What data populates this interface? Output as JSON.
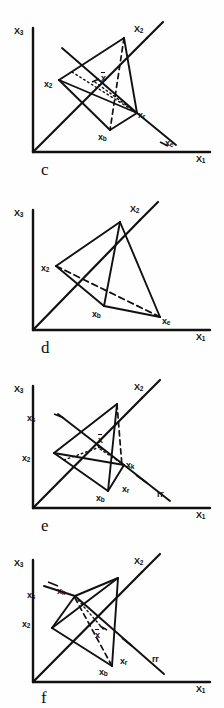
{
  "figure": {
    "caption_letters": [
      "c",
      "d",
      "e",
      "f"
    ],
    "axes": {
      "vertical_label": "X3",
      "vertical_label_base": "X",
      "vertical_label_sub": "3",
      "horizontal_label": "X1",
      "horizontal_label_base": "X",
      "horizontal_label_sub": "1",
      "diagonal_label": "X2",
      "diagonal_label_base": "X",
      "diagonal_label_sub": "2"
    },
    "panels": [
      {
        "id": "panel-c",
        "letter": "c",
        "title": "Simplex reflection and expansion",
        "vertex_labels": [
          {
            "name": "x2",
            "base": "x",
            "sub": "2",
            "overline": false,
            "x": 44,
            "y": 79
          },
          {
            "name": "xbar",
            "base": "x",
            "sub": "",
            "overline": true,
            "x": 101,
            "y": 77
          },
          {
            "name": "xr",
            "base": "x",
            "sub": "r",
            "overline": false,
            "x": 138,
            "y": 112
          },
          {
            "name": "xb",
            "base": "x",
            "sub": "b",
            "overline": false,
            "x": 100,
            "y": 133
          },
          {
            "name": "xe",
            "base": "x",
            "sub": "e",
            "overline": false,
            "x": 162,
            "y": 141
          }
        ]
      },
      {
        "id": "panel-d",
        "letter": "d",
        "title": "New simplex after expansion accepted",
        "vertex_labels": [
          {
            "name": "x2",
            "base": "x",
            "sub": "2",
            "overline": false,
            "x": 44,
            "y": 263
          },
          {
            "name": "xb",
            "base": "x",
            "sub": "b",
            "overline": false,
            "x": 97,
            "y": 311
          },
          {
            "name": "xe",
            "base": "x",
            "sub": "e",
            "overline": false,
            "x": 163,
            "y": 319
          }
        ]
      },
      {
        "id": "panel-e",
        "letter": "e",
        "title": "Contraction toward reflected point",
        "vertex_labels": [
          {
            "name": "xs",
            "base": "x",
            "sub": "s",
            "overline": false,
            "x": 27,
            "y": 415
          },
          {
            "name": "x2",
            "base": "x",
            "sub": "2",
            "overline": false,
            "x": 22,
            "y": 455
          },
          {
            "name": "xbar",
            "base": "x",
            "sub": "",
            "overline": true,
            "x": 98,
            "y": 437
          },
          {
            "name": "xk",
            "base": "x",
            "sub": "k",
            "overline": false,
            "x": 121,
            "y": 458
          },
          {
            "name": "xr",
            "base": "x",
            "sub": "r",
            "overline": false,
            "x": 122,
            "y": 486
          },
          {
            "name": "xb",
            "base": "x",
            "sub": "b",
            "overline": false,
            "x": 96,
            "y": 497
          },
          {
            "name": "rr",
            "base": "rr",
            "sub": "",
            "overline": false,
            "x": 155,
            "y": 490
          }
        ]
      },
      {
        "id": "panel-f",
        "letter": "f",
        "title": "New simplex after contraction",
        "vertex_labels": [
          {
            "name": "xs",
            "base": "x",
            "sub": "s",
            "overline": false,
            "x": 27,
            "y": 592
          },
          {
            "name": "xk",
            "base": "x",
            "sub": "k",
            "overline": false,
            "x": 57,
            "y": 588
          },
          {
            "name": "x2",
            "base": "x",
            "sub": "2",
            "overline": false,
            "x": 22,
            "y": 619
          },
          {
            "name": "xbar",
            "base": "x",
            "sub": "",
            "overline": true,
            "x": 93,
            "y": 626
          },
          {
            "name": "xr",
            "base": "x",
            "sub": "r",
            "overline": false,
            "x": 120,
            "y": 658
          },
          {
            "name": "xb",
            "base": "x",
            "sub": "b",
            "overline": false,
            "x": 96,
            "y": 670
          },
          {
            "name": "rr",
            "base": "rr",
            "sub": "",
            "overline": false,
            "x": 150,
            "y": 655
          }
        ]
      }
    ],
    "colors": {
      "ink": "#111111",
      "paper": "#fefefe"
    }
  }
}
